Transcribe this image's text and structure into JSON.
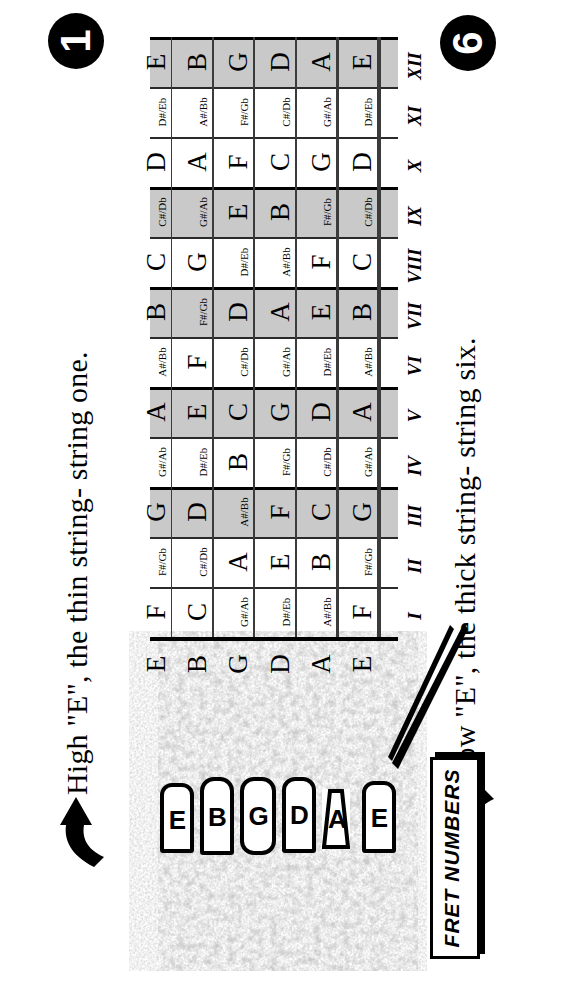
{
  "poster": {
    "title_top": "High \"E\", the thin string- string one.",
    "title_bottom": "Low \"E\", the thick string- string six.",
    "badge_top": "1",
    "badge_bottom": "6",
    "callout_label": "FRET NUMBERS",
    "arrow_top_icon": "block-arrow-right-icon",
    "arrow_bottom_icon": "block-arrow-left-icon",
    "shade_color": "#c9c9c9",
    "ink_color": "#000000"
  },
  "fretboard": {
    "fret_numbers": [
      "I",
      "II",
      "III",
      "IV",
      "V",
      "VI",
      "VII",
      "VIII",
      "IX",
      "X",
      "XI",
      "XII"
    ],
    "marker_frets": [
      "III",
      "V",
      "VII",
      "IX",
      "XII"
    ],
    "open_notes": [
      "E",
      "B",
      "G",
      "D",
      "A",
      "E"
    ],
    "tuner_letters": [
      "E",
      "B",
      "G",
      "D",
      "A",
      "E"
    ],
    "strings": [
      {
        "number": "1",
        "open": "E",
        "naturals": [
          "F",
          "",
          "G",
          "",
          "A",
          "",
          "B",
          "C",
          "",
          "D",
          "",
          "E"
        ],
        "accidentals": [
          "",
          "F#/Gb",
          "",
          "G#/Ab",
          "",
          "A#/Bb",
          "",
          "",
          "C#/Db",
          "",
          "D#/Eb",
          ""
        ]
      },
      {
        "number": "2",
        "open": "B",
        "naturals": [
          "C",
          "",
          "D",
          "",
          "E",
          "F",
          "",
          "G",
          "",
          "A",
          "",
          "B"
        ],
        "accidentals": [
          "",
          "C#/Db",
          "",
          "D#/Eb",
          "",
          "",
          "F#/Gb",
          "",
          "G#/Ab",
          "",
          "A#/Bb",
          ""
        ]
      },
      {
        "number": "3",
        "open": "G",
        "naturals": [
          "",
          "A",
          "",
          "B",
          "C",
          "",
          "D",
          "",
          "E",
          "F",
          "",
          "G"
        ],
        "accidentals": [
          "G#/Ab",
          "",
          "A#/Bb",
          "",
          "",
          "C#/Db",
          "",
          "D#/Eb",
          "",
          "",
          "F#/Gb",
          ""
        ]
      },
      {
        "number": "4",
        "open": "D",
        "naturals": [
          "",
          "E",
          "F",
          "",
          "G",
          "",
          "A",
          "",
          "B",
          "C",
          "",
          "D"
        ],
        "accidentals": [
          "D#/Eb",
          "",
          "",
          "F#/Gb",
          "",
          "G#/Ab",
          "",
          "A#/Bb",
          "",
          "",
          "C#/Db",
          ""
        ]
      },
      {
        "number": "5",
        "open": "A",
        "naturals": [
          "",
          "B",
          "C",
          "",
          "D",
          "",
          "E",
          "F",
          "",
          "G",
          "",
          "A"
        ],
        "accidentals": [
          "A#/Bb",
          "",
          "",
          "C#/Db",
          "",
          "D#/Eb",
          "",
          "",
          "F#/Gb",
          "",
          "G#/Ab",
          ""
        ]
      },
      {
        "number": "6",
        "open": "E",
        "naturals": [
          "F",
          "",
          "G",
          "",
          "A",
          "",
          "B",
          "C",
          "",
          "D",
          "",
          "E"
        ],
        "accidentals": [
          "",
          "F#/Gb",
          "",
          "G#/Ab",
          "",
          "A#/Bb",
          "",
          "",
          "C#/Db",
          "",
          "D#/Eb",
          ""
        ]
      }
    ]
  }
}
